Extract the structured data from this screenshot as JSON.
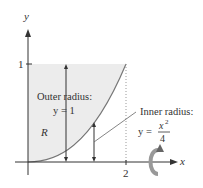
{
  "axes": {
    "x_label": "x",
    "y_label": "y",
    "x_tick": "2",
    "y_tick": "1"
  },
  "region_label": "R",
  "outer": {
    "title": "Outer radius:",
    "eq": "y = 1"
  },
  "inner": {
    "title": "Inner radius:",
    "eq_lhs": "y =",
    "num": "x",
    "exp": "2",
    "den": "4"
  },
  "colors": {
    "fill": "#ececec",
    "curve": "#777777",
    "axis": "#333333"
  }
}
